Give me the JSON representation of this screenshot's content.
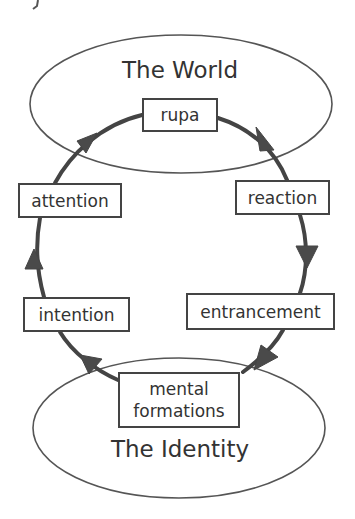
{
  "diagram": {
    "regions": {
      "top": {
        "label": "The World"
      },
      "bottom": {
        "label": "The Identity"
      }
    },
    "nodes": {
      "rupa": {
        "label": "rupa"
      },
      "reaction": {
        "label": "reaction"
      },
      "entrancement": {
        "label": "entrancement"
      },
      "mental_formations": {
        "line1": "mental",
        "line2": "formations"
      },
      "intention": {
        "label": "intention"
      },
      "attention": {
        "label": "attention"
      }
    },
    "cycle_order": [
      "rupa",
      "reaction",
      "entrancement",
      "mental formations",
      "intention",
      "attention"
    ],
    "edges": [
      {
        "from": "rupa",
        "to": "reaction"
      },
      {
        "from": "reaction",
        "to": "entrancement"
      },
      {
        "from": "entrancement",
        "to": "mental formations"
      },
      {
        "from": "mental formations",
        "to": "intention"
      },
      {
        "from": "intention",
        "to": "attention"
      },
      {
        "from": "attention",
        "to": "rupa"
      }
    ],
    "colors": {
      "stroke": "#444444",
      "text": "#333333",
      "background": "#ffffff"
    }
  }
}
